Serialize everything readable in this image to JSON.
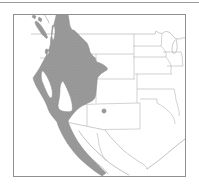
{
  "page": {
    "background": "#ffffff",
    "divider_color": "#9a9a9a"
  },
  "map": {
    "figure_type": "species range map",
    "region_shown": "Western United States and northwestern Mexico",
    "frame_color": "#8f8f8f",
    "sea_land_background": "#ffffff",
    "boundary_color": "#b4b4b4",
    "coast_color": "#a6a6a6",
    "lakes_color": "#b0b0b0",
    "range": {
      "label": "shaded species range",
      "fill": "#9b9b9b",
      "stipple_dot_color": "#878787",
      "edge_color": "#8d8d8d",
      "areas_covered": "Pacific coast of British Columbia and Vancouver Island, Washington, Oregon, Idaho, western Montana, Nevada, Utah with tongue into western Colorado, California except Central Valley and southeastern deserts, southern California coast, Baja California peninsula"
    },
    "isolated_record": {
      "label": "isolated record dot",
      "fill": "#979797",
      "edge_color": "#7d7d7d",
      "location": "northern New Mexico"
    }
  }
}
